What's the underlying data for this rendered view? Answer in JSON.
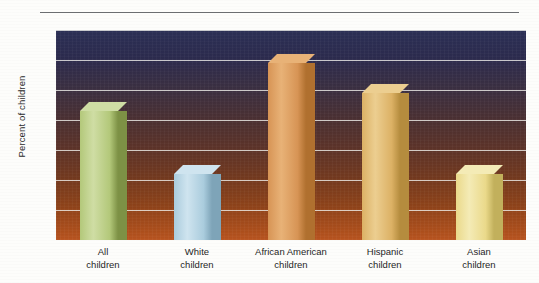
{
  "chart_data": {
    "type": "bar",
    "title": "",
    "subtitle": "",
    "xlabel": "",
    "ylabel": "Percent of children",
    "ylim": [
      0,
      35
    ],
    "grid": true,
    "legend": "none",
    "y_ticks": [
      0,
      5,
      10,
      15,
      20,
      25,
      30,
      35
    ],
    "y_tick_labels": [
      "0",
      "5",
      "10",
      "15",
      "20",
      "25",
      "30",
      "35"
    ],
    "categories": [
      "All\nchildren",
      "White\nchildren",
      "African American\nchildren",
      "Hispanic\nchildren",
      "Asian\nchildren"
    ],
    "values": [
      21.5,
      11,
      29.5,
      24.5,
      11
    ],
    "bar_colors": [
      "#b3c87a",
      "#aaccdd",
      "#d79455",
      "#dcb165",
      "#ead98a"
    ],
    "bars": [
      {
        "label_line1": "All",
        "label_line2": "children",
        "value": 21.5,
        "color": "#b3c87a",
        "side_color": "#7d9145",
        "top_color": "#cfdda4"
      },
      {
        "label_line1": "White",
        "label_line2": "children",
        "value": 11.0,
        "color": "#aaccdd",
        "side_color": "#7ea4b8",
        "top_color": "#cfe4ef"
      },
      {
        "label_line1": "African American",
        "label_line2": "children",
        "value": 29.5,
        "color": "#d79455",
        "side_color": "#b0702f",
        "top_color": "#e8b277"
      },
      {
        "label_line1": "Hispanic",
        "label_line2": "children",
        "value": 24.5,
        "color": "#dcb165",
        "side_color": "#b58c3e",
        "top_color": "#ecce90"
      },
      {
        "label_line1": "Asian",
        "label_line2": "children",
        "value": 11.0,
        "color": "#ead98a",
        "side_color": "#c2b05c",
        "top_color": "#f4ebb6"
      }
    ],
    "plot_background": {
      "gradient_top": "#2b2f55",
      "gradient_bottom": "#b85420"
    },
    "gridline_color": "#f0f0eb",
    "axis_text_color": "#2b2b2b"
  }
}
